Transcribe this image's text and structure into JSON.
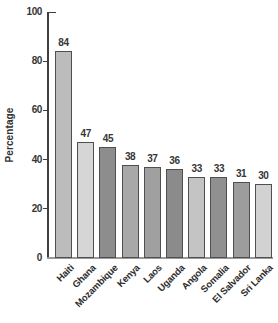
{
  "figure": {
    "background_color": "#ffffff",
    "axis_color": "#3f3f3f",
    "baseline_color": "#9a9a9a",
    "text_color": "#363636"
  },
  "chart_data": {
    "type": "bar",
    "title": "",
    "xlabel": "",
    "ylabel": "Percentage",
    "categories": [
      "Haiti",
      "Ghana",
      "Mozambique",
      "Kenya",
      "Laos",
      "Uganda",
      "Angola",
      "Somalia",
      "El Salvador",
      "Sri Lanka"
    ],
    "values": [
      84,
      47,
      45,
      38,
      37,
      36,
      33,
      33,
      31,
      30
    ],
    "bar_colors": [
      "#bcbcbc",
      "#d6d6d6",
      "#8d8d8d",
      "#a8a8a8",
      "#a0a0a0",
      "#8b8b8b",
      "#c4c4c4",
      "#909090",
      "#9d9d9d",
      "#d2d2d2"
    ],
    "bar_border_color": "#4f4f4f",
    "value_labels_shown": true,
    "ylim": [
      0,
      100
    ],
    "yticks": [
      0,
      20,
      40,
      60,
      80,
      100
    ],
    "grid": false,
    "legend": "none",
    "x_label_rotation_deg": 45
  }
}
